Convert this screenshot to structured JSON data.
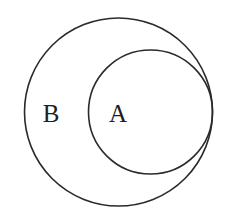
{
  "diagram": {
    "type": "venn-subset",
    "stroke_color": "#2a2a2a",
    "background": "#ffffff",
    "sets": [
      {
        "id": "B",
        "label": "B",
        "circle": {
          "cx": 118.5,
          "cy": 112,
          "r": 94
        },
        "label_pos": {
          "x": 51,
          "y": 122
        }
      },
      {
        "id": "A",
        "label": "A",
        "circle": {
          "cx": 150.5,
          "cy": 112,
          "r": 62
        },
        "label_pos": {
          "x": 118,
          "y": 122
        }
      }
    ],
    "relation": "A ⊂ B"
  }
}
